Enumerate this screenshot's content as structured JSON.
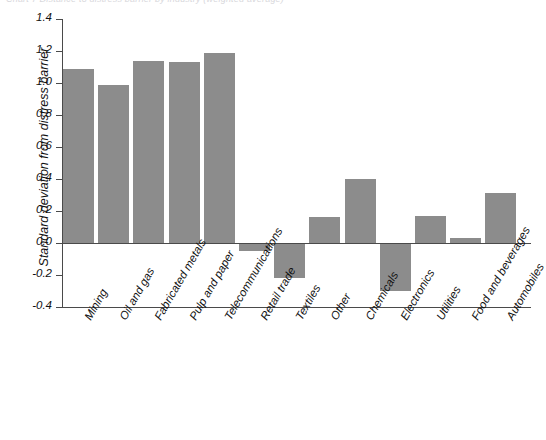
{
  "figure": {
    "cropped_title": "Chart 7  Distance to distress barrier by industry (weighted average)",
    "ylabel": "Standard deviation from distress barrier"
  },
  "chart_data": {
    "type": "bar",
    "title": "",
    "xlabel": "",
    "ylabel": "Standard deviation from distress barrier",
    "ylim": [
      -0.4,
      1.4
    ],
    "ytick_step": 0.2,
    "yticks": [
      "1.4",
      "1.2",
      "1.0",
      "0.8",
      "0.6",
      "0.4",
      "0.2",
      "0.0",
      "-0.2",
      "-0.4"
    ],
    "ytick_values": [
      1.4,
      1.2,
      1.0,
      0.8,
      0.6,
      0.4,
      0.2,
      0.0,
      -0.2,
      -0.4
    ],
    "grid": false,
    "legend": "none",
    "bar_color": "#8c8c8c",
    "zero_reference_line": 0.0,
    "categories": [
      "Mining",
      "Oil and gas",
      "Fabricated metals",
      "Pulp and paper",
      "Telecommunications",
      "Retail trade",
      "Textiles",
      "Other",
      "Chemicals",
      "Electronics",
      "Utilities",
      "Food and beverages",
      "Automobiles"
    ],
    "values": [
      1.09,
      0.99,
      1.14,
      1.13,
      1.19,
      -0.05,
      -0.22,
      0.16,
      0.4,
      -0.3,
      0.17,
      0.03,
      0.31
    ]
  }
}
